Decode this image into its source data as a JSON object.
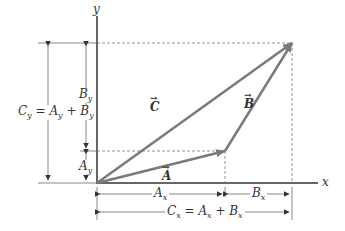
{
  "diagram": {
    "axes": {
      "x_label": "x",
      "y_label": "y"
    },
    "vectors": [
      {
        "name": "A",
        "label": "A",
        "from": [
          97,
          183
        ],
        "to": [
          225,
          151
        ]
      },
      {
        "name": "B",
        "label": "B",
        "from": [
          225,
          151
        ],
        "to": [
          292,
          43
        ]
      },
      {
        "name": "C",
        "label": "C",
        "from": [
          97,
          183
        ],
        "to": [
          292,
          43
        ]
      }
    ],
    "labels": {
      "A_vec": "A",
      "B_vec": "B",
      "C_vec": "C",
      "Ax": "A",
      "Ax_sub": "x",
      "Bx": "B",
      "Bx_sub": "x",
      "Cx_eq": "C",
      "Cx_eq_rest": " = A",
      "Cx_eq_rest2": " + B",
      "By": "B",
      "By_sub": "y",
      "Ay": "A",
      "Ay_sub": "y",
      "Cy": "C",
      "Cy_rest": " = A",
      "Cy_rest2": " + B",
      "sub_x": "x",
      "sub_y": "y"
    },
    "colors": {
      "vector": "#7a7a7a",
      "axis": "#333333",
      "guide": "#666666"
    }
  }
}
